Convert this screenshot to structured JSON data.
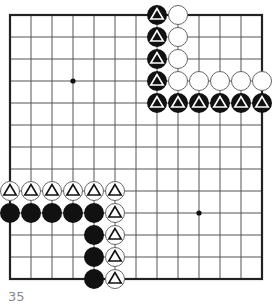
{
  "diagram": {
    "type": "go-board-fragment",
    "grid": {
      "cols": 13,
      "rows": 13,
      "origin_x": 10,
      "origin_y": 15,
      "dx": 21,
      "dy": 22
    },
    "star_points": [
      [
        3,
        3
      ],
      [
        9,
        9
      ]
    ],
    "stones": [
      {
        "c": 7,
        "r": 0,
        "color": "black",
        "mark": "triangle"
      },
      {
        "c": 7,
        "r": 1,
        "color": "black",
        "mark": "triangle"
      },
      {
        "c": 7,
        "r": 2,
        "color": "black",
        "mark": "triangle"
      },
      {
        "c": 7,
        "r": 3,
        "color": "black",
        "mark": "triangle"
      },
      {
        "c": 7,
        "r": 4,
        "color": "black",
        "mark": "triangle"
      },
      {
        "c": 8,
        "r": 4,
        "color": "black",
        "mark": "triangle"
      },
      {
        "c": 9,
        "r": 4,
        "color": "black",
        "mark": "triangle"
      },
      {
        "c": 10,
        "r": 4,
        "color": "black",
        "mark": "triangle"
      },
      {
        "c": 11,
        "r": 4,
        "color": "black",
        "mark": "triangle"
      },
      {
        "c": 12,
        "r": 4,
        "color": "black",
        "mark": "triangle"
      },
      {
        "c": 8,
        "r": 0,
        "color": "white",
        "mark": ""
      },
      {
        "c": 8,
        "r": 1,
        "color": "white",
        "mark": ""
      },
      {
        "c": 8,
        "r": 2,
        "color": "white",
        "mark": ""
      },
      {
        "c": 8,
        "r": 3,
        "color": "white",
        "mark": ""
      },
      {
        "c": 9,
        "r": 3,
        "color": "white",
        "mark": ""
      },
      {
        "c": 10,
        "r": 3,
        "color": "white",
        "mark": ""
      },
      {
        "c": 11,
        "r": 3,
        "color": "white",
        "mark": ""
      },
      {
        "c": 12,
        "r": 3,
        "color": "white",
        "mark": ""
      },
      {
        "c": 0,
        "r": 8,
        "color": "white",
        "mark": "triangle"
      },
      {
        "c": 1,
        "r": 8,
        "color": "white",
        "mark": "triangle"
      },
      {
        "c": 2,
        "r": 8,
        "color": "white",
        "mark": "triangle"
      },
      {
        "c": 3,
        "r": 8,
        "color": "white",
        "mark": "triangle"
      },
      {
        "c": 4,
        "r": 8,
        "color": "white",
        "mark": "triangle"
      },
      {
        "c": 5,
        "r": 8,
        "color": "white",
        "mark": "triangle"
      },
      {
        "c": 5,
        "r": 9,
        "color": "white",
        "mark": "triangle"
      },
      {
        "c": 5,
        "r": 10,
        "color": "white",
        "mark": "triangle"
      },
      {
        "c": 5,
        "r": 11,
        "color": "white",
        "mark": "triangle"
      },
      {
        "c": 5,
        "r": 12,
        "color": "white",
        "mark": "triangle"
      },
      {
        "c": 0,
        "r": 9,
        "color": "black",
        "mark": ""
      },
      {
        "c": 1,
        "r": 9,
        "color": "black",
        "mark": ""
      },
      {
        "c": 2,
        "r": 9,
        "color": "black",
        "mark": ""
      },
      {
        "c": 3,
        "r": 9,
        "color": "black",
        "mark": ""
      },
      {
        "c": 4,
        "r": 9,
        "color": "black",
        "mark": ""
      },
      {
        "c": 4,
        "r": 10,
        "color": "black",
        "mark": ""
      },
      {
        "c": 4,
        "r": 11,
        "color": "black",
        "mark": ""
      },
      {
        "c": 4,
        "r": 12,
        "color": "black",
        "mark": ""
      }
    ],
    "caption": "35",
    "colors": {
      "line": "#555555",
      "edge": "#222222",
      "black": "#111111",
      "white": "#ffffff"
    }
  }
}
